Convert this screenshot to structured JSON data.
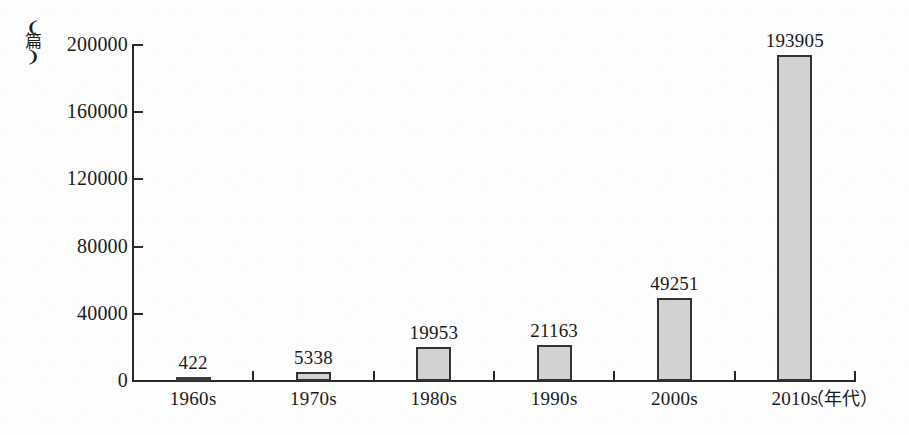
{
  "chart_data": {
    "type": "bar",
    "title": "",
    "subtitle": "",
    "xlabel": "（年代）",
    "ylabel": "（篇）",
    "categories": [
      "1960s",
      "1970s",
      "1980s",
      "1990s",
      "2000s",
      "2010s"
    ],
    "values": [
      422,
      5338,
      19953,
      21163,
      49251,
      193905
    ],
    "value_labels": [
      "422",
      "5338",
      "19953",
      "21163",
      "49251",
      "193905"
    ],
    "ylim": [
      0,
      200000
    ],
    "ytick_labels": [
      "0",
      "40000",
      "80000",
      "120000",
      "160000",
      "200000"
    ],
    "ytick_values": [
      0,
      40000,
      80000,
      120000,
      160000,
      200000
    ],
    "grid": false,
    "legend": false,
    "legend_position": "none",
    "bar_fill_color": "#d2d2d2",
    "bar_border_color": "#333333",
    "axis_color": "#2a2a2a",
    "background_color": "#fdfdfd",
    "text_color": "#1a1a1a"
  },
  "axis": {
    "y_unit_paren_open": "(",
    "y_unit_paren_close": ")",
    "y_unit_cjk": "篇",
    "x_unit": "（年代）"
  }
}
